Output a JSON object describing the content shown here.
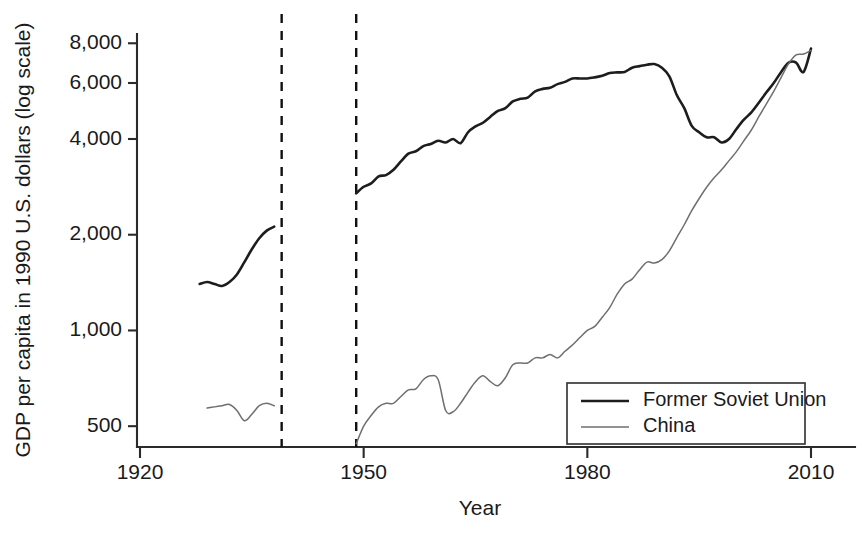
{
  "chart_data": {
    "type": "line",
    "title": "",
    "xlabel": "Year",
    "ylabel": "GDP per capita in 1990 U.S. dollars (log scale)",
    "xlim": [
      1920,
      2010
    ],
    "ylim": [
      430,
      8600
    ],
    "yscale": "log",
    "grid": false,
    "legend_position": "lower-right",
    "xticks": [
      1920,
      1950,
      1980,
      2010
    ],
    "xtick_labels": [
      "1920",
      "1950",
      "1980",
      "2010"
    ],
    "yticks": [
      500,
      1000,
      2000,
      4000,
      6000,
      8000
    ],
    "ytick_labels": [
      "500",
      "1,000",
      "2,000",
      "4,000",
      "6,000",
      "8,000"
    ],
    "annotations": [
      {
        "name": "war-start-line",
        "type": "vline",
        "x": 1939,
        "style": "dashed"
      },
      {
        "name": "war-end-line",
        "type": "vline",
        "x": 1949,
        "style": "dashed"
      }
    ],
    "series": [
      {
        "name": "Former Soviet Union",
        "color": "#1d1d1d",
        "width": 2.6,
        "segments": [
          {
            "x": [
              1928,
              1929,
              1930,
              1931,
              1932,
              1933,
              1934,
              1935,
              1936,
              1937,
              1938
            ],
            "y": [
              1400,
              1420,
              1400,
              1380,
              1420,
              1500,
              1640,
              1800,
              1950,
              2060,
              2120
            ]
          },
          {
            "x": [
              1949,
              1950,
              1951,
              1952,
              1953,
              1954,
              1955,
              1956,
              1957,
              1958,
              1959,
              1960,
              1961,
              1962,
              1963,
              1964,
              1965,
              1966,
              1967,
              1968,
              1969,
              1970,
              1971,
              1972,
              1973,
              1974,
              1975,
              1976,
              1977,
              1978,
              1979,
              1980,
              1981,
              1982,
              1983,
              1984,
              1985,
              1986,
              1987,
              1988,
              1989,
              1990,
              1991,
              1992,
              1993,
              1994,
              1995,
              1996,
              1997,
              1998,
              1999,
              2000,
              2001,
              2002,
              2003,
              2004,
              2005,
              2006,
              2007,
              2008,
              2009,
              2010
            ],
            "y": [
              2700,
              2830,
              2900,
              3050,
              3080,
              3200,
              3400,
              3600,
              3660,
              3800,
              3860,
              3950,
              3900,
              4000,
              3880,
              4200,
              4380,
              4500,
              4700,
              4900,
              5000,
              5250,
              5350,
              5400,
              5650,
              5750,
              5800,
              5950,
              6050,
              6200,
              6200,
              6200,
              6250,
              6320,
              6450,
              6480,
              6500,
              6700,
              6780,
              6850,
              6880,
              6700,
              6300,
              5500,
              5000,
              4400,
              4200,
              4050,
              4050,
              3900,
              4000,
              4300,
              4600,
              4850,
              5200,
              5600,
              6000,
              6500,
              6950,
              6950,
              6500,
              7700
            ]
          }
        ]
      },
      {
        "name": "China",
        "color": "#6f6f6f",
        "width": 1.5,
        "segments": [
          {
            "x": [
              1929,
              1930,
              1931,
              1932,
              1933,
              1934,
              1935,
              1936,
              1937,
              1938
            ],
            "y": [
              570,
              575,
              580,
              585,
              560,
              520,
              545,
              580,
              590,
              580
            ]
          },
          {
            "x": [
              1949,
              1950,
              1951,
              1952,
              1953,
              1954,
              1955,
              1956,
              1957,
              1958,
              1959,
              1960,
              1961,
              1962,
              1963,
              1964,
              1965,
              1966,
              1967,
              1968,
              1969,
              1970,
              1971,
              1972,
              1973,
              1974,
              1975,
              1976,
              1977,
              1978,
              1979,
              1980,
              1981,
              1982,
              1983,
              1984,
              1985,
              1986,
              1987,
              1988,
              1989,
              1990,
              1991,
              1992,
              1993,
              1994,
              1995,
              1996,
              1997,
              1998,
              1999,
              2000,
              2001,
              2002,
              2003,
              2004,
              2005,
              2006,
              2007,
              2008,
              2009,
              2010
            ],
            "y": [
              440,
              500,
              540,
              575,
              590,
              590,
              620,
              650,
              655,
              700,
              720,
              700,
              560,
              555,
              590,
              640,
              690,
              720,
              690,
              670,
              710,
              780,
              790,
              790,
              820,
              820,
              840,
              820,
              860,
              900,
              950,
              1000,
              1030,
              1100,
              1180,
              1300,
              1400,
              1450,
              1550,
              1640,
              1630,
              1670,
              1780,
              1960,
              2150,
              2380,
              2600,
              2820,
              3020,
              3200,
              3420,
              3650,
              3950,
              4270,
              4700,
              5150,
              5650,
              6250,
              6900,
              7350,
              7400,
              7600
            ]
          }
        ]
      }
    ],
    "legend": [
      {
        "label": "Former Soviet Union",
        "color": "#1d1d1d",
        "width": 2.6
      },
      {
        "label": "China",
        "color": "#6f6f6f",
        "width": 1.5
      }
    ]
  }
}
